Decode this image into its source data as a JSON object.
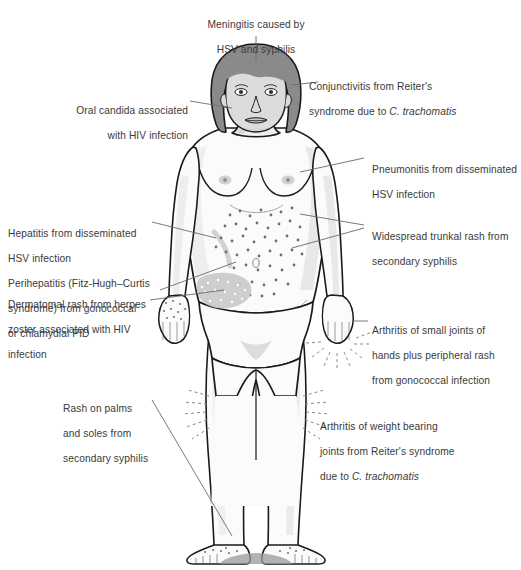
{
  "figure": {
    "colors": {
      "background": "#ffffff",
      "outline": "#1a1a1a",
      "body_fill": "#fbfbfb",
      "shading": "#e4e4e4",
      "hair": "#8a8a8a",
      "face": "#dcdcdc",
      "rash_dot": "#6e6e6e",
      "dermatomal_band": "#c9c9c9",
      "leader_line": "#555555",
      "text": "#3a3a3a"
    }
  },
  "labels": {
    "meningitis": {
      "id": "meningitis",
      "line1": "Meningitis caused by",
      "line2": "HSV and syphilis",
      "target": "head"
    },
    "conjunctivitis": {
      "id": "conjunctivitis",
      "line1": "Conjunctivitis from Reiter's",
      "line2_pre": "syndrome due to ",
      "line2_italic": "C. trachomatis",
      "target": "eye"
    },
    "oral_candida": {
      "id": "oral-candida",
      "line1": "Oral candida associated",
      "line2": "with HIV infection",
      "target": "mouth"
    },
    "pneumonitis": {
      "id": "pneumonitis",
      "line1": "Pneumonitis from disseminated",
      "line2": "HSV infection",
      "target": "chest"
    },
    "trunkal_rash": {
      "id": "trunkal-rash",
      "line1": "Widespread trunkal rash from",
      "line2": "secondary syphilis",
      "target": "abdomen"
    },
    "hepatitis": {
      "id": "hepatitis",
      "line1": "Hepatitis from disseminated",
      "line2": "HSV infection",
      "line3": "Perihepatitis (Fitz-Hugh–Curtis",
      "line4": "syndrome) from gonococcal",
      "line5": "or chlamydial PID",
      "target": "right upper quadrant"
    },
    "dermatomal_rash": {
      "id": "dermatomal-rash",
      "line1": "Dermatomal rash from herpes",
      "line2": "zoster associated with HIV",
      "line3": "infection",
      "target": "flank"
    },
    "hand_arthritis": {
      "id": "hand-arthritis",
      "line1": "Arthritis of small joints of",
      "line2": "hands plus peripheral rash",
      "line3": "from gonococcal infection",
      "target": "left hand"
    },
    "palms_soles_rash": {
      "id": "palms-soles-rash",
      "line1": "Rash on palms",
      "line2": "and soles from",
      "line3": "secondary syphilis",
      "target": "palms and soles"
    },
    "knee_arthritis": {
      "id": "knee-arthritis",
      "line1": "Arthritis of weight bearing",
      "line2_pre": "joints from Reiter's syndrome",
      "line3_pre": "due to ",
      "line3_italic": "C. trachomatis",
      "target": "knees"
    }
  }
}
